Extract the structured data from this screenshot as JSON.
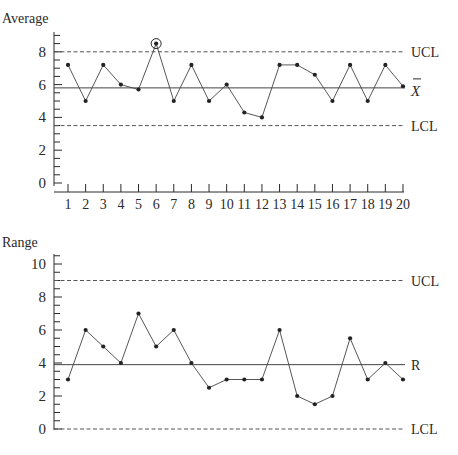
{
  "chart_data": [
    {
      "type": "line",
      "title": "",
      "ylabel": "Average",
      "xlabel": "",
      "ylim": [
        0,
        9
      ],
      "yticks": [
        0,
        2,
        4,
        6,
        8
      ],
      "x": [
        1,
        2,
        3,
        4,
        5,
        6,
        7,
        8,
        9,
        10,
        11,
        12,
        13,
        14,
        15,
        16,
        17,
        18,
        19,
        20
      ],
      "series": [
        {
          "name": "Sample average",
          "values": [
            7.2,
            5.0,
            7.2,
            6.0,
            5.7,
            8.5,
            5.0,
            7.2,
            5.0,
            6.0,
            4.3,
            4.0,
            7.2,
            7.2,
            6.6,
            5.0,
            7.2,
            5.0,
            7.2,
            5.9
          ]
        }
      ],
      "control_lines": {
        "UCL": 8.0,
        "center": 5.8,
        "LCL": 3.5
      },
      "line_labels": {
        "ucl": "UCL",
        "center": "X̄",
        "lcl": "LCL"
      },
      "annotations": [
        {
          "x": 6,
          "y": 8.5,
          "note": "circled out-of-control point"
        }
      ],
      "grid": false,
      "legend": "none"
    },
    {
      "type": "line",
      "title": "",
      "ylabel": "Range",
      "xlabel": "",
      "ylim": [
        0,
        10.5
      ],
      "yticks": [
        0,
        2,
        4,
        6,
        8,
        10
      ],
      "x": [
        1,
        2,
        3,
        4,
        5,
        6,
        7,
        8,
        9,
        10,
        11,
        12,
        13,
        14,
        15,
        16,
        17,
        18,
        19,
        20
      ],
      "series": [
        {
          "name": "Sample range",
          "values": [
            3,
            6,
            5,
            4,
            7,
            5,
            6,
            4,
            2.5,
            3,
            3,
            3,
            6,
            2,
            1.5,
            2,
            5.5,
            3,
            4,
            3
          ]
        }
      ],
      "control_lines": {
        "UCL": 9.0,
        "center": 3.9,
        "LCL": 0
      },
      "line_labels": {
        "ucl": "UCL",
        "center": "R",
        "lcl": "LCL"
      },
      "grid": false,
      "legend": "none"
    }
  ],
  "top": {
    "ylabel": "Average",
    "ytick_labels": [
      "0",
      "2",
      "4",
      "6",
      "8"
    ],
    "xtick_labels": [
      "1",
      "2",
      "3",
      "4",
      "5",
      "6",
      "7",
      "8",
      "9",
      "10",
      "11",
      "12",
      "13",
      "14",
      "15",
      "16",
      "17",
      "18",
      "19",
      "20"
    ],
    "ucl_label": "UCL",
    "center_label": "X",
    "lcl_label": "LCL"
  },
  "bottom": {
    "ylabel": "Range",
    "ytick_labels": [
      "0",
      "2",
      "4",
      "6",
      "8",
      "10"
    ],
    "ucl_label": "UCL",
    "center_label": "R",
    "lcl_label": "LCL"
  },
  "colors": {
    "ink": "#2a2a2a",
    "dashed": "#555555"
  }
}
